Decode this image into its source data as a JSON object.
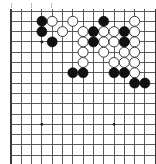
{
  "figure": {
    "board_type": "go-board",
    "visible_columns": 14,
    "visible_rows": 15,
    "colors": {
      "background": "#ffffff",
      "grid_line": "#4a4a4a",
      "board_edge": "#3a3a3a",
      "black_stone": "#111111",
      "white_stone": "#ffffff",
      "white_stone_outline": "#3a3a3a",
      "star_point": "#1a1a1a"
    }
  },
  "geometry": {
    "origin_x": 11,
    "origin_y": 11,
    "spacing": 10.3,
    "stone_radius": 5.0,
    "star_radius": 1.4,
    "columns": 14,
    "rows": 15
  },
  "stones": {
    "black_label": "black",
    "white_label": "white",
    "black": [
      {
        "col": 3,
        "row": 1
      },
      {
        "col": 3,
        "row": 2
      },
      {
        "col": 4,
        "row": 3
      },
      {
        "col": 9,
        "row": 1
      },
      {
        "col": 8,
        "row": 2
      },
      {
        "col": 11,
        "row": 2
      },
      {
        "col": 8,
        "row": 3
      },
      {
        "col": 11,
        "row": 3
      },
      {
        "col": 6,
        "row": 6
      },
      {
        "col": 7,
        "row": 6
      },
      {
        "col": 10,
        "row": 6
      },
      {
        "col": 11,
        "row": 6
      },
      {
        "col": 12,
        "row": 7
      },
      {
        "col": 13,
        "row": 7
      }
    ],
    "white": [
      {
        "col": 4,
        "row": 1
      },
      {
        "col": 6,
        "row": 1
      },
      {
        "col": 12,
        "row": 1
      },
      {
        "col": 5,
        "row": 2
      },
      {
        "col": 7,
        "row": 2
      },
      {
        "col": 9,
        "row": 2
      },
      {
        "col": 10,
        "row": 2
      },
      {
        "col": 12,
        "row": 2
      },
      {
        "col": 7,
        "row": 3
      },
      {
        "col": 9,
        "row": 3
      },
      {
        "col": 10,
        "row": 3
      },
      {
        "col": 12,
        "row": 3
      },
      {
        "col": 7,
        "row": 4
      },
      {
        "col": 9,
        "row": 4
      },
      {
        "col": 11,
        "row": 4
      },
      {
        "col": 12,
        "row": 4
      },
      {
        "col": 7,
        "row": 5
      },
      {
        "col": 10,
        "row": 5
      },
      {
        "col": 11,
        "row": 5
      },
      {
        "col": 12,
        "row": 5
      },
      {
        "col": 12,
        "row": 6
      }
    ]
  },
  "star_points": [
    {
      "col": 3,
      "row": 3
    },
    {
      "col": 3,
      "row": 11
    },
    {
      "col": 10,
      "row": 11
    }
  ],
  "top_ticks": [
    {
      "x": 11
    },
    {
      "x": 31
    },
    {
      "x": 51
    }
  ]
}
